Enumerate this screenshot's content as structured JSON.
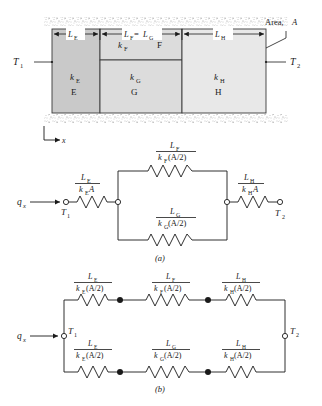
{
  "figure": {
    "wall": {
      "area_label": "Area, A",
      "temp_left": "T",
      "temp_left_sub": "1",
      "temp_right": "T",
      "temp_right_sub": "2",
      "axis_label": "x",
      "dims": [
        {
          "name": "L",
          "sub": "E"
        },
        {
          "name": "L",
          "sub": "F",
          "eq": "= L",
          "eq_sub": "G"
        },
        {
          "name": "L",
          "sub": "H"
        }
      ],
      "blocks": [
        {
          "k": "k",
          "k_sub": "E",
          "id": "E",
          "fill": "#c9c9c9"
        },
        {
          "k": "k",
          "k_sub": "F",
          "id": "F",
          "fill": "#dcdcdc"
        },
        {
          "k": "k",
          "k_sub": "G",
          "id": "G",
          "fill": "#dcdcdc"
        },
        {
          "k": "k",
          "k_sub": "H",
          "id": "H",
          "fill": "#e8e8e8"
        }
      ]
    },
    "circuit_a": {
      "caption": "(a)",
      "flux_label": "q",
      "flux_sub": "x",
      "node_left": "T",
      "node_left_sub": "1",
      "node_right": "T",
      "node_right_sub": "2",
      "resistors": [
        {
          "pos": "left-series",
          "num": "L",
          "num_sub": "E",
          "den": "k",
          "den_sub": "E",
          "den_tail": "A"
        },
        {
          "pos": "parallel-top",
          "num": "L",
          "num_sub": "F",
          "den": "k",
          "den_sub": "F",
          "den_tail": "(A/2)"
        },
        {
          "pos": "parallel-bottom",
          "num": "L",
          "num_sub": "G",
          "den": "k",
          "den_sub": "G",
          "den_tail": "(A/2)"
        },
        {
          "pos": "right-series",
          "num": "L",
          "num_sub": "H",
          "den": "k",
          "den_sub": "H",
          "den_tail": "A"
        }
      ]
    },
    "circuit_b": {
      "caption": "(b)",
      "flux_label": "q",
      "flux_sub": "x",
      "node_left": "T",
      "node_left_sub": "1",
      "node_right": "T",
      "node_right_sub": "2",
      "top_branch": [
        {
          "num": "L",
          "num_sub": "E",
          "den": "k",
          "den_sub": "E",
          "den_tail": "(A/2)"
        },
        {
          "num": "L",
          "num_sub": "F",
          "den": "k",
          "den_sub": "F",
          "den_tail": "(A/2)"
        },
        {
          "num": "L",
          "num_sub": "H",
          "den": "k",
          "den_sub": "H",
          "den_tail": "(A/2)"
        }
      ],
      "bottom_branch": [
        {
          "num": "L",
          "num_sub": "E",
          "den": "k",
          "den_sub": "E",
          "den_tail": "(A/2)"
        },
        {
          "num": "L",
          "num_sub": "G",
          "den": "k",
          "den_sub": "G",
          "den_tail": "(A/2)"
        },
        {
          "num": "L",
          "num_sub": "H",
          "den": "k",
          "den_sub": "H",
          "den_tail": "(A/2)"
        }
      ]
    }
  }
}
